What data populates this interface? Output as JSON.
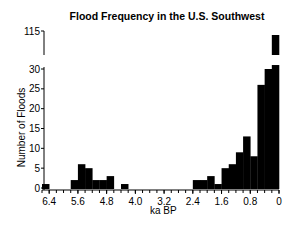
{
  "chart_data": {
    "type": "bar",
    "title": "Flood Frequency in the U.S. Southwest",
    "xlabel": "ka BP",
    "ylabel": "Number of Floods",
    "x_reversed": true,
    "xlim": [
      6.6,
      0
    ],
    "bin_width": 0.2,
    "x_tick_labels": [
      "6.4",
      "5.6",
      "4.8",
      "4.0",
      "3.2",
      "2.4",
      "1.6",
      "0.8",
      "0"
    ],
    "x_tick_values": [
      6.4,
      5.6,
      4.8,
      4.0,
      3.2,
      2.4,
      1.6,
      0.8,
      0
    ],
    "y_tick_labels": [
      "0",
      "5",
      "10",
      "15",
      "20",
      "25",
      "30",
      "115"
    ],
    "y_tick_values": [
      0,
      5,
      10,
      15,
      20,
      25,
      30,
      115
    ],
    "ylim": [
      0,
      115
    ],
    "y_axis_break": [
      31,
      110
    ],
    "grid": false,
    "legend": null,
    "bars": [
      {
        "bin": "6.6-6.4",
        "value": 1
      },
      {
        "bin": "6.4-6.2",
        "value": 0
      },
      {
        "bin": "6.2-6.0",
        "value": 0
      },
      {
        "bin": "6.0-5.8",
        "value": 0
      },
      {
        "bin": "5.8-5.6",
        "value": 2
      },
      {
        "bin": "5.6-5.4",
        "value": 6
      },
      {
        "bin": "5.4-5.2",
        "value": 5
      },
      {
        "bin": "5.2-5.0",
        "value": 2
      },
      {
        "bin": "5.0-4.8",
        "value": 2
      },
      {
        "bin": "4.8-4.6",
        "value": 3
      },
      {
        "bin": "4.6-4.4",
        "value": 0
      },
      {
        "bin": "4.4-4.2",
        "value": 1
      },
      {
        "bin": "4.2-4.0",
        "value": 0
      },
      {
        "bin": "4.0-3.8",
        "value": 0
      },
      {
        "bin": "3.8-3.6",
        "value": 0
      },
      {
        "bin": "3.6-3.4",
        "value": 0
      },
      {
        "bin": "3.4-3.2",
        "value": 0
      },
      {
        "bin": "3.2-3.0",
        "value": 0
      },
      {
        "bin": "3.0-2.8",
        "value": 0
      },
      {
        "bin": "2.8-2.6",
        "value": 0
      },
      {
        "bin": "2.6-2.4",
        "value": 0
      },
      {
        "bin": "2.4-2.2",
        "value": 2
      },
      {
        "bin": "2.2-2.0",
        "value": 2
      },
      {
        "bin": "2.0-1.8",
        "value": 3
      },
      {
        "bin": "1.8-1.6",
        "value": 1
      },
      {
        "bin": "1.6-1.4",
        "value": 5
      },
      {
        "bin": "1.4-1.2",
        "value": 6
      },
      {
        "bin": "1.2-1.0",
        "value": 9
      },
      {
        "bin": "1.0-0.8",
        "value": 13
      },
      {
        "bin": "0.8-0.6",
        "value": 8
      },
      {
        "bin": "0.6-0.4",
        "value": 26
      },
      {
        "bin": "0.4-0.2",
        "value": 30
      },
      {
        "bin": "0.2-0.0",
        "value": 115
      }
    ],
    "bar_color": "#000000"
  }
}
